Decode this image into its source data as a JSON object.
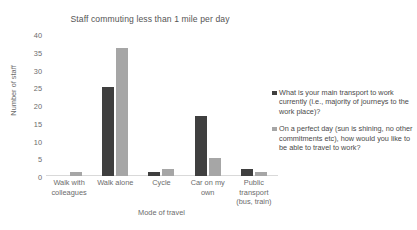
{
  "chart_data": {
    "type": "bar",
    "title": "Staff commuting less than 1 mile per day",
    "xlabel": "Mode of travel",
    "ylabel": "Number of staff",
    "ylim": [
      0,
      40
    ],
    "ytick_step": 5,
    "yticks": [
      "40",
      "35",
      "30",
      "25",
      "20",
      "15",
      "10",
      "5",
      "0"
    ],
    "grid": false,
    "legend_position": "right",
    "categories": [
      "Walk with colleagues",
      "Walk alone",
      "Cycle",
      "Car on my own",
      "Public transport (bus, train)"
    ],
    "category_lines": [
      [
        "Walk with",
        "colleagues"
      ],
      [
        "Walk alone"
      ],
      [
        "Cycle"
      ],
      [
        "Car on my",
        "own"
      ],
      [
        "Public",
        "transport",
        "(bus, train)"
      ]
    ],
    "series": [
      {
        "name": "What is your main transport to work currently (i.e., majority of journeys to the work place)?",
        "color": "#3f3f3f",
        "values": [
          0,
          25,
          1,
          17,
          2
        ]
      },
      {
        "name": "On a perfect day (sun is shining, no other commitments etc), how would you like to be able to travel to work?",
        "color": "#a6a6a6",
        "values": [
          1,
          36,
          2,
          5,
          1
        ]
      }
    ]
  },
  "legend": {
    "entries": [
      {
        "marker": "legend-swatch-dark",
        "label": "What is your main transport to work currently (i.e., majority of journeys to the work place)?"
      },
      {
        "marker": "legend-swatch-light",
        "label": "On a perfect day (sun is shining, no other commitments etc), how would you like to be able to travel to work?"
      }
    ]
  },
  "colors": {
    "series_current": "#3f3f3f",
    "series_perfect_day": "#a6a6a6",
    "axis_line": "#d9d9d9",
    "text": "#6b6b6b",
    "background": "#ffffff"
  }
}
